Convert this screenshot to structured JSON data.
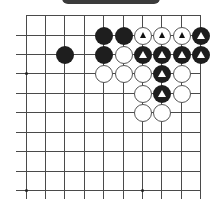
{
  "title_bar": {
    "label": ""
  },
  "board": {
    "columns_x": [
      26,
      45,
      64,
      84,
      103,
      123,
      142,
      161,
      181,
      200
    ],
    "rows_y": [
      15,
      35,
      54,
      73,
      93,
      112,
      132,
      151,
      171,
      190
    ],
    "left_edge_x": 16,
    "bottom_extent_y": 199,
    "star_points": [
      {
        "col": 0,
        "row": 3
      },
      {
        "col": 0,
        "row": 9
      },
      {
        "col": 6,
        "row": 9
      }
    ],
    "stones": [
      {
        "col": 4,
        "row": 1,
        "color": "black",
        "marked": false
      },
      {
        "col": 5,
        "row": 1,
        "color": "black",
        "marked": false
      },
      {
        "col": 6,
        "row": 1,
        "color": "white",
        "marked": true
      },
      {
        "col": 7,
        "row": 1,
        "color": "white",
        "marked": true
      },
      {
        "col": 8,
        "row": 1,
        "color": "white",
        "marked": true
      },
      {
        "col": 9,
        "row": 1,
        "color": "black",
        "marked": true
      },
      {
        "col": 2,
        "row": 2,
        "color": "black",
        "marked": false
      },
      {
        "col": 4,
        "row": 2,
        "color": "black",
        "marked": false
      },
      {
        "col": 5,
        "row": 2,
        "color": "white",
        "marked": false
      },
      {
        "col": 6,
        "row": 2,
        "color": "black",
        "marked": true
      },
      {
        "col": 7,
        "row": 2,
        "color": "black",
        "marked": true
      },
      {
        "col": 8,
        "row": 2,
        "color": "black",
        "marked": true
      },
      {
        "col": 9,
        "row": 2,
        "color": "black",
        "marked": true
      },
      {
        "col": 4,
        "row": 3,
        "color": "white",
        "marked": false
      },
      {
        "col": 5,
        "row": 3,
        "color": "white",
        "marked": false
      },
      {
        "col": 6,
        "row": 3,
        "color": "white",
        "marked": false
      },
      {
        "col": 7,
        "row": 3,
        "color": "black",
        "marked": true
      },
      {
        "col": 8,
        "row": 3,
        "color": "white",
        "marked": false
      },
      {
        "col": 6,
        "row": 4,
        "color": "white",
        "marked": false
      },
      {
        "col": 7,
        "row": 4,
        "color": "black",
        "marked": true
      },
      {
        "col": 8,
        "row": 4,
        "color": "white",
        "marked": false
      },
      {
        "col": 6,
        "row": 5,
        "color": "white",
        "marked": false
      },
      {
        "col": 7,
        "row": 5,
        "color": "white",
        "marked": false
      }
    ],
    "marker_shape": "triangle-icon",
    "colors": {
      "black_stone": "#1e1e1e",
      "white_stone": "#ffffff",
      "line": "#4a4a4a",
      "title_bar": "#3b3b3b"
    }
  }
}
